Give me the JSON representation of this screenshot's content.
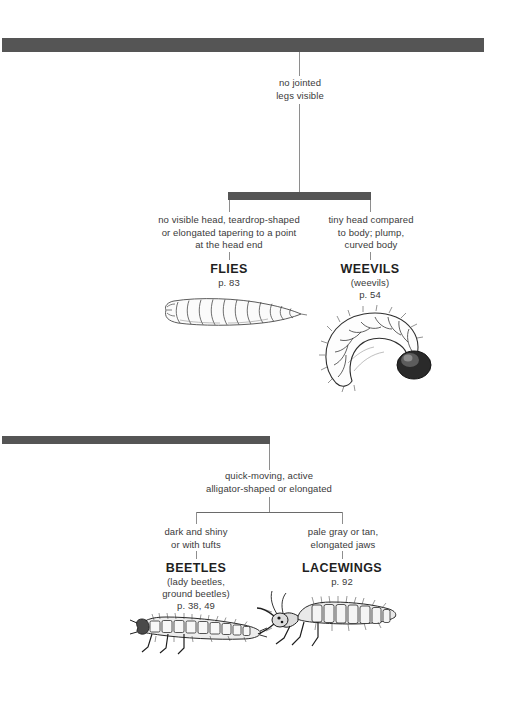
{
  "page": {
    "background": "#ffffff",
    "bar_color": "#555555",
    "line_color": "#8e8e8e",
    "text_color": "#3a3a3a",
    "muted_text_color": "#9a9a9a"
  },
  "branches": {
    "top": {
      "stem_label": "no jointed\nlegs visible",
      "stem_label_line1": "no jointed",
      "stem_label_line2": "legs visible",
      "children": [
        {
          "id": "flies",
          "desc_line1": "no visible head, teardrop-shaped",
          "desc_line2": "or elongated tapering to a point",
          "desc_line3": "at the head end",
          "name": "FLIES",
          "sub": "",
          "page": "p. 83",
          "illustration": "fly-maggot-illustration"
        },
        {
          "id": "weevils",
          "desc_line1": "tiny head compared",
          "desc_line2": "to body; plump,",
          "desc_line3": "curved body",
          "name": "WEEVILS",
          "sub": "(weevils)",
          "page": "p. 54",
          "illustration": "weevil-grub-illustration"
        }
      ]
    },
    "bottom": {
      "stem_label_line1": "quick-moving, active",
      "stem_label_line2": "alligator-shaped or elongated",
      "children": [
        {
          "id": "beetles",
          "desc_line1": "dark and shiny",
          "desc_line2": "or with tufts",
          "desc_line3": "",
          "name": "BEETLES",
          "sub_line1": "(lady beetles,",
          "sub_line2": "ground beetles)",
          "page": "p. 38, 49",
          "illustration": "beetle-larva-illustration"
        },
        {
          "id": "lacewings",
          "desc_line1": "pale gray or tan,",
          "desc_line2": "elongated jaws",
          "desc_line3": "",
          "name": "LACEWINGS",
          "sub_line1": "",
          "sub_line2": "",
          "page": "p. 92",
          "illustration": "lacewing-larva-illustration"
        }
      ]
    }
  }
}
